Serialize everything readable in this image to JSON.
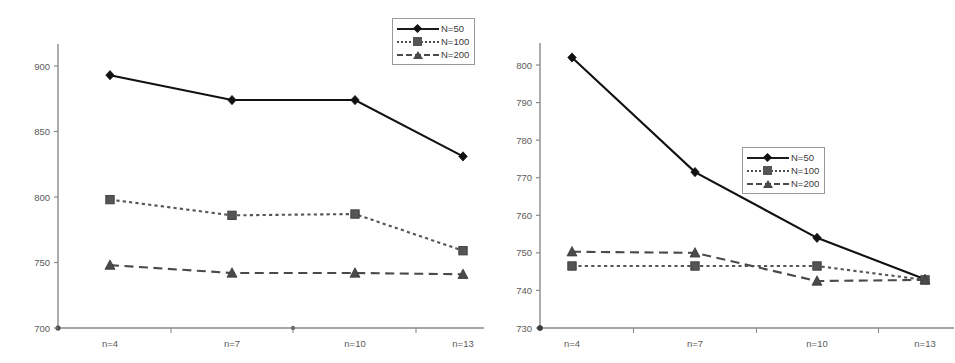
{
  "figure": {
    "panels": [
      "left",
      "right"
    ],
    "series_names": [
      "N=50",
      "N=100",
      "N=200"
    ],
    "colors": {
      "n50": "#111111",
      "n100": "#555555",
      "n200": "#4a4a4a",
      "axis": "#8a8a8a",
      "tick_text": "#5b5b5b"
    }
  },
  "legend": {
    "left": {
      "rows": [
        {
          "label": "N=50",
          "marker": "diamond",
          "line": "solid"
        },
        {
          "label": "N=100",
          "marker": "square",
          "line": "dotted"
        },
        {
          "label": "N=200",
          "marker": "triangle",
          "line": "dashed"
        }
      ]
    },
    "right": {
      "rows": [
        {
          "label": "N=50",
          "marker": "diamond",
          "line": "solid"
        },
        {
          "label": "N=100",
          "marker": "square",
          "line": "dotted"
        },
        {
          "label": "N=200",
          "marker": "triangle",
          "line": "dashed"
        }
      ]
    }
  },
  "chart_data": [
    {
      "panel": "left",
      "type": "line",
      "title": "",
      "xlabel": "",
      "ylabel": "",
      "categories": [
        "n=4",
        "n=7",
        "n=10",
        "n=13"
      ],
      "yticks": [
        700,
        750,
        800,
        850,
        900
      ],
      "ylim": [
        700,
        900
      ],
      "grid": false,
      "legend_position": "top-right",
      "series": [
        {
          "name": "N=50",
          "values": [
            893,
            874,
            874,
            831
          ],
          "marker": "diamond",
          "line": "solid"
        },
        {
          "name": "N=100",
          "values": [
            798,
            786,
            787,
            759
          ],
          "marker": "square",
          "line": "dotted"
        },
        {
          "name": "N=200",
          "values": [
            748,
            742,
            742,
            741
          ],
          "marker": "triangle",
          "line": "dashed"
        }
      ]
    },
    {
      "panel": "right",
      "type": "line",
      "title": "",
      "xlabel": "",
      "ylabel": "",
      "categories": [
        "n=4",
        "n=7",
        "n=10",
        "n=13"
      ],
      "yticks": [
        730,
        740,
        750,
        760,
        770,
        780,
        790,
        800
      ],
      "ylim": [
        730,
        800
      ],
      "grid": false,
      "legend_position": "center",
      "series": [
        {
          "name": "N=50",
          "values": [
            802.0,
            771.5,
            754.0,
            743.0
          ],
          "marker": "diamond",
          "line": "solid"
        },
        {
          "name": "N=100",
          "values": [
            746.5,
            746.5,
            746.5,
            742.8
          ],
          "marker": "square",
          "line": "dotted"
        },
        {
          "name": "N=200",
          "values": [
            750.3,
            750.0,
            742.5,
            742.8
          ],
          "marker": "triangle",
          "line": "dashed"
        }
      ]
    }
  ]
}
